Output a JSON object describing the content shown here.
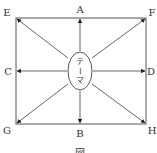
{
  "diagram": {
    "center_label_chars": [
      "テ",
      "ー",
      "マ"
    ],
    "nodes": {
      "A": "A",
      "B": "B",
      "C": "C",
      "D": "D",
      "E": "E",
      "F": "F",
      "G": "G",
      "H": "H"
    },
    "caption": "図",
    "colors": {
      "line": "#555555",
      "text": "#333333",
      "background": "#ffffff"
    }
  }
}
